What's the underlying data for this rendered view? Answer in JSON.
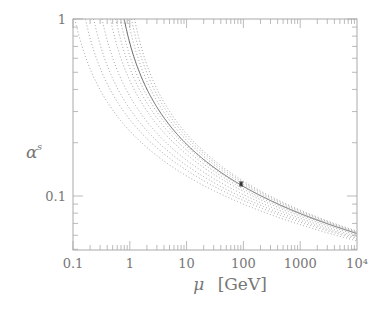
{
  "chart_data": {
    "type": "line",
    "title": "",
    "xlabel": "μ [GeV]",
    "ylabel": "α_s",
    "xscale": "log",
    "yscale": "log",
    "xlim": [
      0.1,
      10000
    ],
    "ylim": [
      0.05,
      1
    ],
    "grid": false,
    "legend": null,
    "x_tick_labels": [
      "0.1",
      "1",
      "10",
      "100",
      "1000",
      "10⁴"
    ],
    "x_ticks": [
      0.1,
      1,
      10,
      100,
      1000,
      10000
    ],
    "y_tick_labels": [
      "0.1",
      "1"
    ],
    "y_ticks": [
      0.1,
      1
    ],
    "series": [
      {
        "name": "central (solid)",
        "style": "solid",
        "alpha_at_mu": {
          "0.8": 1.0,
          "91.2": 0.117,
          "10000": 0.058
        }
      },
      {
        "name": "variant 1",
        "style": "dotted",
        "alpha_at_mu": {
          "0.15": 1.0,
          "1": 0.29,
          "10": 0.145,
          "100": 0.097,
          "10000": 0.056
        }
      },
      {
        "name": "variant 2",
        "style": "dotted",
        "alpha_at_mu": {
          "0.22": 1.0,
          "1": 0.36,
          "10": 0.16,
          "100": 0.104,
          "10000": 0.058
        }
      },
      {
        "name": "variant 3",
        "style": "dotted",
        "alpha_at_mu": {
          "0.3": 1.0,
          "1": 0.45,
          "10": 0.175,
          "100": 0.108,
          "10000": 0.06
        }
      },
      {
        "name": "variant 4",
        "style": "dotted",
        "alpha_at_mu": {
          "0.42": 1.0,
          "1": 0.55,
          "10": 0.19,
          "100": 0.112,
          "10000": 0.061
        }
      },
      {
        "name": "variant 5",
        "style": "dotted",
        "alpha_at_mu": {
          "0.55": 1.0,
          "1": 0.68,
          "10": 0.205,
          "100": 0.116,
          "10000": 0.062
        }
      },
      {
        "name": "variant 6",
        "style": "dotted",
        "alpha_at_mu": {
          "0.65": 1.0,
          "10": 0.215,
          "100": 0.119,
          "10000": 0.063
        }
      },
      {
        "name": "variant 7",
        "style": "dotted",
        "alpha_at_mu": {
          "0.75": 1.0,
          "10": 0.225,
          "100": 0.122,
          "10000": 0.065
        }
      },
      {
        "name": "variant 8",
        "style": "dotted",
        "alpha_at_mu": {
          "0.9": 1.0,
          "10": 0.235,
          "100": 0.125,
          "10000": 0.066
        }
      },
      {
        "name": "variant 9",
        "style": "dotted",
        "alpha_at_mu": {
          "1.0": 1.0,
          "10": 0.245,
          "100": 0.128,
          "10000": 0.067
        }
      }
    ],
    "data_points": [
      {
        "label": "α_s(M_Z)",
        "x": 91.2,
        "y": 0.117,
        "yerr": 0.003
      }
    ]
  },
  "curves_model": [
    {
      "style": "solid",
      "lambda": 0.43,
      "k": 1.62
    },
    {
      "style": "dotted",
      "lambda": 0.055,
      "k": 1.48
    },
    {
      "style": "dotted",
      "lambda": 0.085,
      "k": 1.5
    },
    {
      "style": "dotted",
      "lambda": 0.12,
      "k": 1.52
    },
    {
      "style": "dotted",
      "lambda": 0.17,
      "k": 1.54
    },
    {
      "style": "dotted",
      "lambda": 0.24,
      "k": 1.56
    },
    {
      "style": "dotted",
      "lambda": 0.3,
      "k": 1.57
    },
    {
      "style": "dotted",
      "lambda": 0.36,
      "k": 1.58
    },
    {
      "style": "dotted",
      "lambda": 0.5,
      "k": 1.62
    },
    {
      "style": "dotted",
      "lambda": 0.58,
      "k": 1.63
    },
    {
      "style": "dotted",
      "lambda": 0.66,
      "k": 1.64
    }
  ]
}
